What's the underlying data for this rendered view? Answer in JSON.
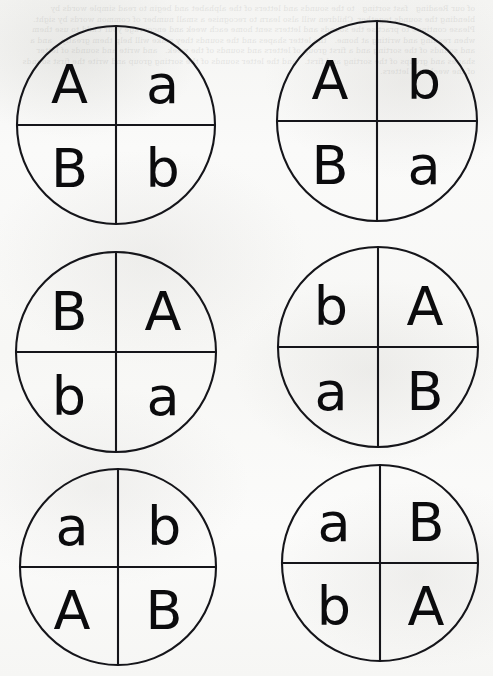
{
  "page": {
    "background_color": "#f8f8f7",
    "ink_color": "#15151a",
    "width": 493,
    "height": 676,
    "layout": "2 columns x 3 rows",
    "bleed_through_note": "faint mirrored text showing through from reverse of scanned page"
  },
  "bleed": {
    "text": "of our Reading   fast sorting   to the sounds and letters of the alphabet and begin to read simple words by blending the sounds together. Children will also learn to recognise a small number of common words by sight. Please continue to practise the sounds and letters sent home each week and encourage your child to use them when reading and writing at home.   the letter shapes and the sounds they make will help them greatly.   and a and sounds of the sorting and a first group of letters and sounds of the week.   and write and sounds of letter shapes and groups of the sorting and first.   and the letter sounds of the sorting group and write the first sounds of the week and letters."
  },
  "cards": [
    {
      "id": "card-1",
      "position": "row-1-left",
      "cx": 116,
      "cy": 125,
      "r": 99,
      "quadrants": {
        "top_left": "A",
        "top_right": "a",
        "bottom_left": "B",
        "bottom_right": "b"
      }
    },
    {
      "id": "card-2",
      "position": "row-1-right",
      "cx": 377,
      "cy": 121,
      "r": 100,
      "quadrants": {
        "top_left": "A",
        "top_right": "b",
        "bottom_left": "B",
        "bottom_right": "a"
      }
    },
    {
      "id": "card-3",
      "position": "row-2-left",
      "cx": 116,
      "cy": 352,
      "r": 100,
      "quadrants": {
        "top_left": "B",
        "top_right": "A",
        "bottom_left": "b",
        "bottom_right": "a"
      }
    },
    {
      "id": "card-4",
      "position": "row-2-right",
      "cx": 378,
      "cy": 347,
      "r": 100,
      "quadrants": {
        "top_left": "b",
        "top_right": "A",
        "bottom_left": "a",
        "bottom_right": "B"
      }
    },
    {
      "id": "card-5",
      "position": "row-3-left",
      "cx": 118,
      "cy": 567,
      "r": 98,
      "quadrants": {
        "top_left": "a",
        "top_right": "b",
        "bottom_left": "A",
        "bottom_right": "B"
      }
    },
    {
      "id": "card-6",
      "position": "row-3-right",
      "cx": 380,
      "cy": 563,
      "r": 98,
      "quadrants": {
        "top_left": "a",
        "top_right": "B",
        "bottom_left": "b",
        "bottom_right": "A"
      }
    }
  ]
}
